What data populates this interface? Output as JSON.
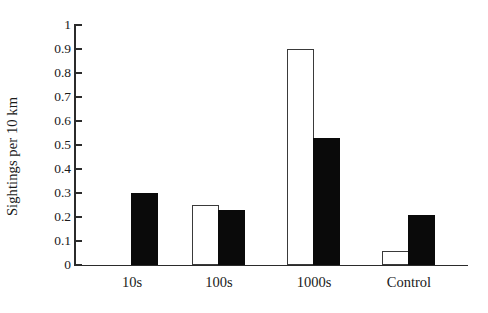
{
  "chart_data": {
    "type": "bar",
    "title": "",
    "subtitle": "",
    "xlabel": "",
    "ylabel": "Sightings per 10 km",
    "categories": [
      "10s",
      "100s",
      "1000s",
      "Control"
    ],
    "series": [
      {
        "name": "white",
        "values": [
          0,
          0.25,
          0.9,
          0.06
        ]
      },
      {
        "name": "black",
        "values": [
          0.3,
          0.23,
          0.53,
          0.21
        ]
      }
    ],
    "ylim": [
      0,
      1
    ],
    "ytick_values": [
      0,
      0.1,
      0.2,
      0.3,
      0.4,
      0.5,
      0.6,
      0.7,
      0.8,
      0.9,
      1
    ],
    "ytick_labels": [
      "0",
      "0.1",
      "0.2",
      "0.3",
      "0.4",
      "0.5",
      "0.6",
      "0.7",
      "0.8",
      "0.9",
      "1"
    ],
    "grid": false,
    "legend": "none",
    "colors": {
      "white_series": "#ffffff",
      "black_series": "#0a0a0a",
      "axis": "#2b2b2b",
      "text": "#1a1a1a",
      "background": "#ffffff"
    }
  }
}
